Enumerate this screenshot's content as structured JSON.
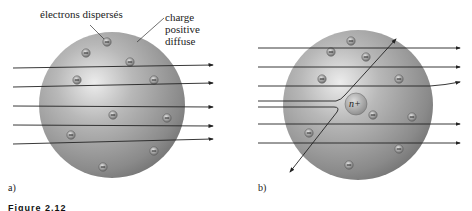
{
  "panel_a": {
    "label": "a)",
    "annotation_electrons": "électrons dispersés",
    "annotation_charge": [
      "charge",
      "positive",
      "diffuse"
    ]
  },
  "panel_b": {
    "label": "b)",
    "nucleus_label": "n+"
  },
  "caption": "Figure 2.12",
  "colors": {
    "sphere_light": "#e6e6e6",
    "sphere_mid": "#a8a8a8",
    "sphere_dark": "#6e6e6e",
    "ray": "#222222",
    "background": "#ffffff"
  }
}
